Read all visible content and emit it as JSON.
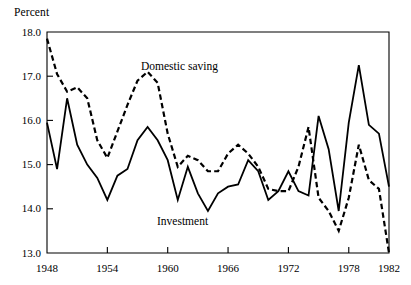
{
  "axis_unit_label": "Percent",
  "series_labels": {
    "domestic_saving": "Domestic saving",
    "investment": "Investment"
  },
  "chart_data": {
    "type": "line",
    "title": "",
    "subtitle": "",
    "xlabel": "",
    "ylabel": "Percent",
    "xlim": [
      1948,
      1982
    ],
    "ylim": [
      13.0,
      18.0
    ],
    "yticks": [
      "13.0",
      "14.0",
      "15.0",
      "16.0",
      "17.0",
      "18.0"
    ],
    "ytick_values": [
      13.0,
      14.0,
      15.0,
      16.0,
      17.0,
      18.0
    ],
    "xticks": [
      "1948",
      "1954",
      "1960",
      "1966",
      "1972",
      "1978",
      "1982"
    ],
    "xtick_values": [
      1948,
      1954,
      1960,
      1966,
      1972,
      1978,
      1982
    ],
    "grid": false,
    "legend": "inline-annotations",
    "x": [
      1948,
      1949,
      1950,
      1951,
      1952,
      1953,
      1954,
      1955,
      1956,
      1957,
      1958,
      1959,
      1960,
      1961,
      1962,
      1963,
      1964,
      1965,
      1966,
      1967,
      1968,
      1969,
      1970,
      1971,
      1972,
      1973,
      1974,
      1975,
      1976,
      1977,
      1978,
      1979,
      1980,
      1981,
      1982
    ],
    "series": [
      {
        "name": "Domestic saving",
        "style": "dashed",
        "color": "#000000",
        "values": [
          17.85,
          17.05,
          16.65,
          16.75,
          16.5,
          15.55,
          15.15,
          15.75,
          16.35,
          16.9,
          17.1,
          16.85,
          15.7,
          14.95,
          15.2,
          15.1,
          14.85,
          14.85,
          15.25,
          15.45,
          15.25,
          14.95,
          14.45,
          14.4,
          14.4,
          14.95,
          15.85,
          14.25,
          13.95,
          13.5,
          14.25,
          15.45,
          14.65,
          14.45,
          13.0
        ]
      },
      {
        "name": "Investment",
        "style": "solid",
        "color": "#000000",
        "values": [
          15.95,
          14.9,
          16.5,
          15.45,
          15.0,
          14.7,
          14.2,
          14.75,
          14.9,
          15.55,
          15.85,
          15.55,
          15.1,
          14.2,
          14.95,
          14.35,
          13.95,
          14.35,
          14.5,
          14.55,
          15.1,
          14.85,
          14.2,
          14.4,
          14.85,
          14.4,
          14.3,
          16.1,
          15.35,
          13.95,
          15.95,
          17.25,
          15.9,
          15.7,
          14.5
        ]
      }
    ],
    "annotations": [
      {
        "text": "Domestic saving",
        "series": "Domestic saving",
        "x": 1956
      },
      {
        "text": "Investment",
        "series": "Investment",
        "x": 1964
      }
    ]
  }
}
